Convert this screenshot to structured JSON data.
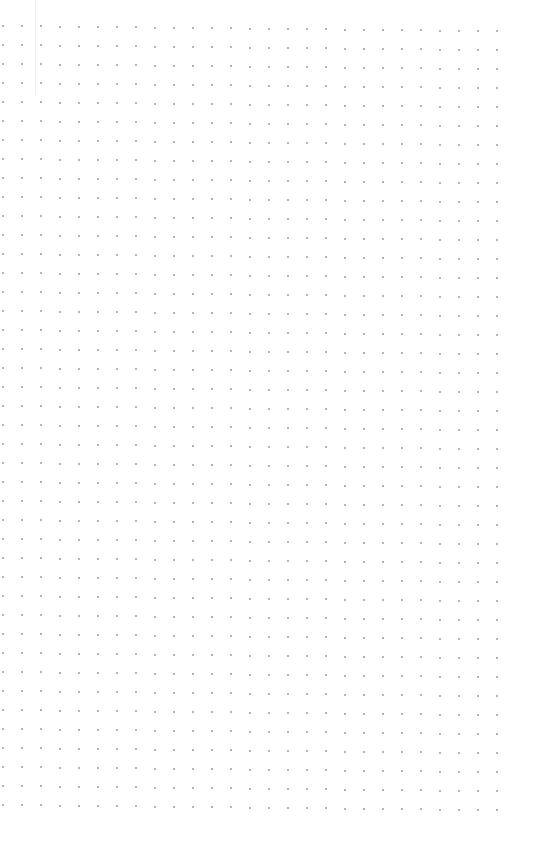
{
  "page": {
    "type": "dot-grid-paper",
    "background_color": "#ffffff",
    "dot_color": "#9a9a9a"
  }
}
